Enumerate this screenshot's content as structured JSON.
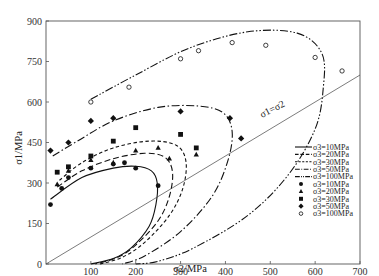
{
  "chart_data": {
    "type": "scatter",
    "title": "",
    "xlabel": "σ2/MPa",
    "ylabel": "σ1/MPa",
    "xlim": [
      0,
      700
    ],
    "ylim": [
      0,
      900
    ],
    "x_ticks": [
      "100",
      "200",
      "300",
      "400",
      "500",
      "600",
      "700"
    ],
    "y_ticks": [
      "0",
      "150",
      "300",
      "450",
      "600",
      "750",
      "900"
    ],
    "grid": false,
    "legend_position": "lower right, inside plot",
    "annotation": "σ1=σ2",
    "reference_line": {
      "name": "σ1=σ2",
      "x": [
        0,
        700
      ],
      "y": [
        0,
        700
      ]
    },
    "fitted_curves": [
      {
        "name": "σ3=10MPa",
        "style": "solid"
      },
      {
        "name": "σ3=20MPa",
        "style": "long-dash"
      },
      {
        "name": "σ3=30MPa",
        "style": "short-dash"
      },
      {
        "name": "σ3=50MPa",
        "style": "dash-dot"
      },
      {
        "name": "σ3=100MPa",
        "style": "dash-dot-dot"
      }
    ],
    "series": [
      {
        "name": "σ3=10MPa",
        "marker": "filled-circle",
        "x": [
          10,
          35,
          50,
          100,
          150,
          175,
          200,
          250
        ],
        "y": [
          220,
          280,
          320,
          355,
          370,
          375,
          355,
          290
        ]
      },
      {
        "name": "σ3=20MPa",
        "marker": "filled-triangle",
        "x": [
          25,
          50,
          100,
          150,
          200,
          250,
          275,
          335
        ],
        "y": [
          295,
          345,
          385,
          375,
          420,
          430,
          390,
          405
        ]
      },
      {
        "name": "σ3=30MPa",
        "marker": "filled-square",
        "x": [
          25,
          50,
          100,
          150,
          200,
          300,
          335
        ],
        "y": [
          340,
          360,
          400,
          455,
          505,
          480,
          430
        ]
      },
      {
        "name": "σ3=50MPa",
        "marker": "filled-diamond",
        "x": [
          10,
          50,
          100,
          150,
          300,
          410,
          435
        ],
        "y": [
          420,
          450,
          530,
          540,
          565,
          540,
          465
        ]
      },
      {
        "name": "σ3=100MPa",
        "marker": "open-circle",
        "x": [
          100,
          185,
          300,
          340,
          415,
          490,
          600,
          660
        ],
        "y": [
          600,
          655,
          760,
          790,
          820,
          810,
          765,
          715
        ]
      }
    ]
  },
  "legend": {
    "lines": [
      "σ3=10MPa",
      "σ3=20MPa",
      "σ3=30MPa",
      "σ3=50MPa",
      "σ3=100MPa"
    ],
    "markers": [
      "σ3=10MPa",
      "σ3=20MPa",
      "σ3=30MPa",
      "σ3=50MPa",
      "σ3=100MPa"
    ]
  }
}
